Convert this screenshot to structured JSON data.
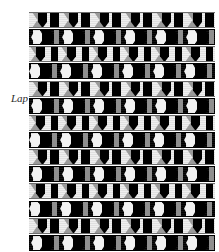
{
  "figure": {
    "label_left": "Lap",
    "top_caption_fragment": "",
    "colors": {
      "ground_light": "#ebebeb",
      "ground_dark": "#000000",
      "knot_grey": "#9a9a9a",
      "connector_grey": "#8f8f8f",
      "highlight": "#f2f2f2",
      "rule": "#6e6e6e"
    },
    "grid": {
      "rows": 14,
      "row_height_px": 16,
      "repeat_width_px": 31,
      "repeats_per_row": 6,
      "origin_x_px": 29,
      "origin_y_px": 12,
      "width_px": 186,
      "height_px": 240
    },
    "rows": [
      {
        "index": 1,
        "type": "light"
      },
      {
        "index": 2,
        "type": "dark"
      },
      {
        "index": 3,
        "type": "light"
      },
      {
        "index": 4,
        "type": "dark"
      },
      {
        "index": 5,
        "type": "light"
      },
      {
        "index": 6,
        "type": "dark"
      },
      {
        "index": 7,
        "type": "light"
      },
      {
        "index": 8,
        "type": "dark"
      },
      {
        "index": 9,
        "type": "light"
      },
      {
        "index": 10,
        "type": "dark"
      },
      {
        "index": 11,
        "type": "light"
      },
      {
        "index": 12,
        "type": "dark"
      },
      {
        "index": 13,
        "type": "light"
      },
      {
        "index": 14,
        "type": "dark"
      }
    ]
  }
}
